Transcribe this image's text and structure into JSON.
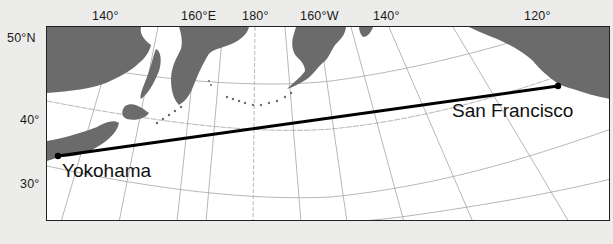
{
  "map": {
    "title": "Great-circle route across the North Pacific",
    "longitude_labels": [
      {
        "text": "140°",
        "x": 92
      },
      {
        "text": "160°E",
        "x": 183
      },
      {
        "text": "180°",
        "x": 243
      },
      {
        "text": "160°W",
        "x": 300
      },
      {
        "text": "140°",
        "x": 373
      },
      {
        "text": "120°",
        "x": 524
      }
    ],
    "latitude_labels": [
      {
        "text": "50°N",
        "y": 31
      },
      {
        "text": "40°",
        "y": 113
      },
      {
        "text": "30°",
        "y": 177
      }
    ],
    "cities": {
      "origin": {
        "name": "Yokohama",
        "x": 57,
        "y": 155
      },
      "destination": {
        "name": "San Francisco",
        "x": 557,
        "y": 85
      }
    },
    "colors": {
      "land": "#6b6b6b",
      "ocean": "#ffffff",
      "graticule": "#9a9a9a",
      "route": "#000000",
      "background": "#ececea"
    }
  }
}
